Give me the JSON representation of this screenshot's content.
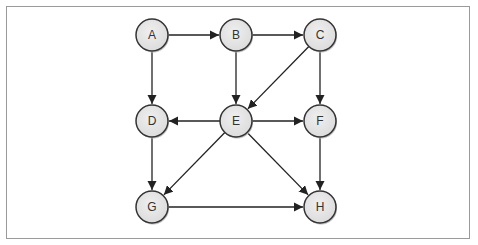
{
  "diagram": {
    "type": "directed-graph",
    "nodes": [
      {
        "id": "A",
        "label": "A",
        "x": 152,
        "y": 35
      },
      {
        "id": "B",
        "label": "B",
        "x": 236,
        "y": 35
      },
      {
        "id": "C",
        "label": "C",
        "x": 320,
        "y": 35
      },
      {
        "id": "D",
        "label": "D",
        "x": 152,
        "y": 121
      },
      {
        "id": "E",
        "label": "E",
        "x": 236,
        "y": 121
      },
      {
        "id": "F",
        "label": "F",
        "x": 320,
        "y": 121
      },
      {
        "id": "G",
        "label": "G",
        "x": 152,
        "y": 207
      },
      {
        "id": "H",
        "label": "H",
        "x": 320,
        "y": 207
      }
    ],
    "edges": [
      {
        "from": "A",
        "to": "B"
      },
      {
        "from": "B",
        "to": "C"
      },
      {
        "from": "A",
        "to": "D"
      },
      {
        "from": "B",
        "to": "E"
      },
      {
        "from": "C",
        "to": "E"
      },
      {
        "from": "C",
        "to": "F"
      },
      {
        "from": "E",
        "to": "D"
      },
      {
        "from": "E",
        "to": "F"
      },
      {
        "from": "D",
        "to": "G"
      },
      {
        "from": "E",
        "to": "G"
      },
      {
        "from": "E",
        "to": "H"
      },
      {
        "from": "F",
        "to": "H"
      },
      {
        "from": "G",
        "to": "H"
      }
    ],
    "colors": {
      "node_fill": "#e6e6e6",
      "node_stroke": "#333333",
      "edge": "#222222",
      "frame": "#9a9a9a"
    }
  }
}
